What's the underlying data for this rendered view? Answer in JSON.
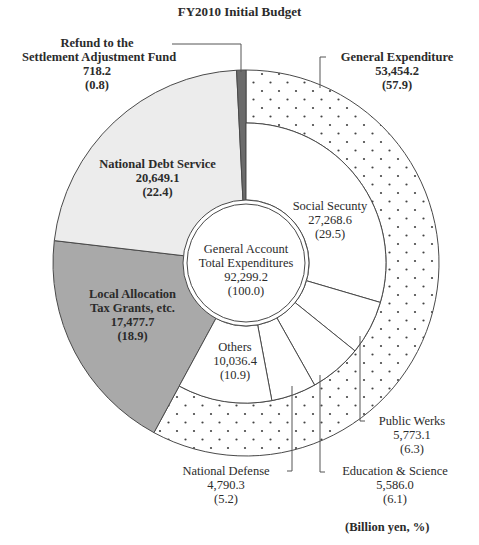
{
  "chart_data": {
    "type": "pie",
    "subtype": "nested-donut",
    "title": "FY2010 Initial Budget",
    "unit_note": "(Billion yen, %)",
    "center": {
      "label_line1": "General Account",
      "label_line2": "Total Expenditures",
      "value": "92,299.2",
      "percent": "(100.0)"
    },
    "outer_ring": [
      {
        "name": "General Expenditure",
        "value": 53454.2,
        "value_text": "53,454.2",
        "percent": 57.9,
        "percent_text": "(57.9)",
        "fill": "dots"
      },
      {
        "name": "Local Allocation Tax Grants, etc.",
        "value": 17477.7,
        "value_text": "17,477.7",
        "percent": 18.9,
        "percent_text": "(18.9)",
        "fill": "#a9a9a9"
      },
      {
        "name": "National Debt Service",
        "value": 20649.1,
        "value_text": "20,649.1",
        "percent": 22.4,
        "percent_text": "(22.4)",
        "fill": "#ececec"
      },
      {
        "name": "Refund to the Settlement Adjustment Fund",
        "value": 718.2,
        "value_text": "718.2",
        "percent": 0.8,
        "percent_text": "(0.8)",
        "fill": "#6b6b6b"
      }
    ],
    "inner_ring_general_expenditure": [
      {
        "name": "Social Secunty",
        "value": 27268.6,
        "value_text": "27,268.6",
        "percent": 29.5,
        "percent_text": "(29.5)"
      },
      {
        "name": "Public Werks",
        "value": 5773.1,
        "value_text": "5,773.1",
        "percent": 6.3,
        "percent_text": "(6.3)"
      },
      {
        "name": "Education & Science",
        "value": 5586.0,
        "value_text": "5,586.0",
        "percent": 6.1,
        "percent_text": "(6.1)"
      },
      {
        "name": "National Defense",
        "value": 4790.3,
        "value_text": "4,790.3",
        "percent": 5.2,
        "percent_text": "(5.2)"
      },
      {
        "name": "Others",
        "value": 10036.4,
        "value_text": "10,036.4",
        "percent": 10.9,
        "percent_text": "(10.9)"
      }
    ],
    "start_angle": "top, clockwise",
    "legend": "none (direct labels)"
  },
  "labels": {
    "refund": {
      "line1": "Refund to the",
      "line2": "Settlement Adjustment Fund",
      "value": "718.2",
      "pct": "(0.8)"
    },
    "general": {
      "line1": "General Expenditure",
      "value": "53,454.2",
      "pct": "(57.9)"
    },
    "debt": {
      "line1": "National Debt Service",
      "value": "20,649.1",
      "pct": "(22.4)"
    },
    "social": {
      "line1": "Social Secunty",
      "value": "27,268.6",
      "pct": "(29.5)"
    },
    "local": {
      "line1": "Local Allocation",
      "line2": "Tax Grants, etc.",
      "value": "17,477.7",
      "pct": "(18.9)"
    },
    "others": {
      "line1": "Others",
      "value": "10,036.4",
      "pct": "(10.9)"
    },
    "public": {
      "line1": "Public Werks",
      "value": "5,773.1",
      "pct": "(6.3)"
    },
    "defense": {
      "line1": "National Defense",
      "value": "4,790.3",
      "pct": "(5.2)"
    },
    "education": {
      "line1": "Education & Science",
      "value": "5,586.0",
      "pct": "(6.1)"
    }
  }
}
